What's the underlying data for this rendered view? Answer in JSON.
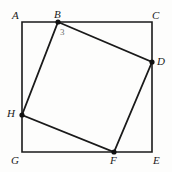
{
  "figure": {
    "type": "geometry-diagram",
    "background_color": "#fdfdfc",
    "stroke_color": "#1a1a1a",
    "label_color": "#1a1a1a",
    "measure_color": "#6f6f6f",
    "canvas": {
      "width": 172,
      "height": 172
    },
    "outer_square": {
      "name": "ACEG",
      "stroke_width": 1.6,
      "corners": [
        {
          "id": "A",
          "x": 22,
          "y": 22
        },
        {
          "id": "C",
          "x": 152,
          "y": 22
        },
        {
          "id": "E",
          "x": 152,
          "y": 152
        },
        {
          "id": "G",
          "x": 22,
          "y": 152
        }
      ]
    },
    "inner_quadrilateral": {
      "name": "BDFH",
      "stroke_width": 1.8,
      "vertices": [
        {
          "id": "B",
          "x": 58,
          "y": 22,
          "on_side": "AC"
        },
        {
          "id": "D",
          "x": 152,
          "y": 62,
          "on_side": "CE"
        },
        {
          "id": "F",
          "x": 114,
          "y": 152,
          "on_side": "EG"
        },
        {
          "id": "H",
          "x": 22,
          "y": 115,
          "on_side": "GA"
        }
      ]
    },
    "vertex_dots": [
      {
        "id": "dot-B",
        "x": 58,
        "y": 22,
        "r": 2.6
      },
      {
        "id": "dot-D",
        "x": 152,
        "y": 62,
        "r": 2.6
      },
      {
        "id": "dot-F",
        "x": 114,
        "y": 152,
        "r": 2.6
      },
      {
        "id": "dot-H",
        "x": 22,
        "y": 115,
        "r": 2.6
      }
    ],
    "labels": [
      {
        "id": "label-A",
        "text": "A",
        "x": 12,
        "y": 10
      },
      {
        "id": "label-B",
        "text": "B",
        "x": 54,
        "y": 9
      },
      {
        "id": "label-C",
        "text": "C",
        "x": 152,
        "y": 10
      },
      {
        "id": "label-D",
        "text": "D",
        "x": 157,
        "y": 56
      },
      {
        "id": "label-E",
        "text": "E",
        "x": 153,
        "y": 155
      },
      {
        "id": "label-F",
        "text": "F",
        "x": 110,
        "y": 155
      },
      {
        "id": "label-G",
        "text": "G",
        "x": 11,
        "y": 155
      },
      {
        "id": "label-H",
        "text": "H",
        "x": 7,
        "y": 108
      }
    ],
    "measures": [
      {
        "id": "measure-3",
        "text": "3",
        "x": 60,
        "y": 28,
        "refers_to": "segment from B"
      }
    ]
  }
}
